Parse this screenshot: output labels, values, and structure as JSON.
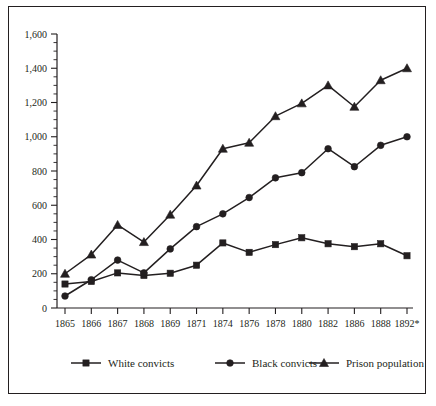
{
  "chart_data": {
    "type": "line",
    "title": "",
    "subtitle": "",
    "xlabel": "",
    "ylabel": "",
    "grid": false,
    "legend_position": "bottom",
    "ylim": [
      0,
      1600
    ],
    "y_major_ticks": [
      0,
      200,
      400,
      600,
      800,
      1000,
      1200,
      1400,
      1600
    ],
    "y_tick_labels": [
      "0",
      "200",
      "400",
      "600",
      "800",
      "1,000",
      "1,200",
      "1,400",
      "1,600"
    ],
    "y_minor_tick_step": 50,
    "categories": [
      "1865",
      "1866",
      "1867",
      "1868",
      "1869",
      "1871",
      "1874",
      "1876",
      "1878",
      "1880",
      "1882",
      "1886",
      "1888",
      "1892*"
    ],
    "series": [
      {
        "name": "White convicts",
        "marker": "square",
        "values": [
          140,
          155,
          205,
          190,
          203,
          250,
          380,
          325,
          370,
          410,
          375,
          358,
          375,
          305
        ]
      },
      {
        "name": "Black convicts",
        "marker": "circle",
        "values": [
          70,
          165,
          280,
          205,
          345,
          475,
          550,
          645,
          760,
          790,
          930,
          825,
          950,
          1000
        ]
      },
      {
        "name": "Prison population",
        "marker": "triangle",
        "values": [
          200,
          312,
          485,
          385,
          545,
          715,
          930,
          965,
          1120,
          1195,
          1300,
          1175,
          1330,
          1400
        ]
      }
    ]
  },
  "legend": {
    "items": [
      {
        "label": "White convicts",
        "marker": "square"
      },
      {
        "label": "Black convicts",
        "marker": "circle"
      },
      {
        "label": "Prison population",
        "marker": "triangle"
      }
    ]
  },
  "colors": {
    "ink": "#231f20",
    "background": "#ffffff"
  }
}
